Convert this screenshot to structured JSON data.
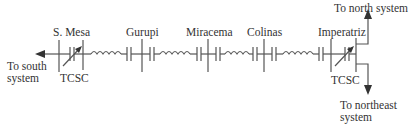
{
  "diagram": {
    "substations": [
      {
        "id": "s-mesa",
        "label": "S. Mesa"
      },
      {
        "id": "gurupi",
        "label": "Gurupi"
      },
      {
        "id": "miracema",
        "label": "Miracema"
      },
      {
        "id": "colinas",
        "label": "Colinas"
      },
      {
        "id": "imperatriz",
        "label": "Imperatriz"
      }
    ],
    "devices": [
      {
        "id": "tcsc-s-mesa",
        "label": "TCSC"
      },
      {
        "id": "tcsc-imperatriz",
        "label": "TCSC"
      }
    ],
    "connections": {
      "south": {
        "line1": "To south",
        "line2": "system"
      },
      "north": {
        "label": "To north system"
      },
      "northeast": {
        "line1": "To northeast",
        "line2": "system"
      }
    },
    "colors": {
      "line": "#555555",
      "text": "#333333",
      "background": "#ffffff"
    }
  }
}
